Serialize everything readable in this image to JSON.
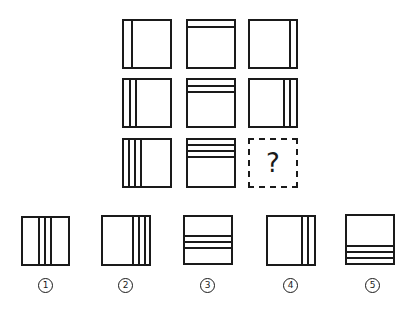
{
  "puzzle": {
    "grid": [
      {
        "row": 1,
        "col": 1,
        "orientation": "vertical",
        "side": "left",
        "lines": 1
      },
      {
        "row": 1,
        "col": 2,
        "orientation": "horizontal",
        "side": "top",
        "lines": 1
      },
      {
        "row": 1,
        "col": 3,
        "orientation": "vertical",
        "side": "right",
        "lines": 1
      },
      {
        "row": 2,
        "col": 1,
        "orientation": "vertical",
        "side": "left",
        "lines": 2
      },
      {
        "row": 2,
        "col": 2,
        "orientation": "horizontal",
        "side": "top",
        "lines": 2
      },
      {
        "row": 2,
        "col": 3,
        "orientation": "vertical",
        "side": "right",
        "lines": 2
      },
      {
        "row": 3,
        "col": 1,
        "orientation": "vertical",
        "side": "left",
        "lines": 3
      },
      {
        "row": 3,
        "col": 2,
        "orientation": "horizontal",
        "side": "top",
        "lines": 3
      },
      {
        "row": 3,
        "col": 3,
        "missing": true,
        "text": "?"
      }
    ],
    "options": [
      {
        "label": "①",
        "number": 1,
        "orientation": "vertical",
        "side": "middle",
        "lines": 3
      },
      {
        "label": "②",
        "number": 2,
        "orientation": "vertical",
        "side": "right",
        "lines": 3
      },
      {
        "label": "③",
        "number": 3,
        "orientation": "horizontal",
        "side": "middle",
        "lines": 3
      },
      {
        "label": "④",
        "number": 4,
        "orientation": "vertical",
        "side": "right",
        "lines": 2
      },
      {
        "label": "⑤",
        "number": 5,
        "orientation": "horizontal",
        "side": "bottom",
        "lines": 3
      }
    ],
    "missing_symbol": "?",
    "option_labels": [
      "1",
      "2",
      "3",
      "4",
      "5"
    ],
    "colors": {
      "line": "#1a1a1a",
      "background": "#ffffff"
    }
  }
}
